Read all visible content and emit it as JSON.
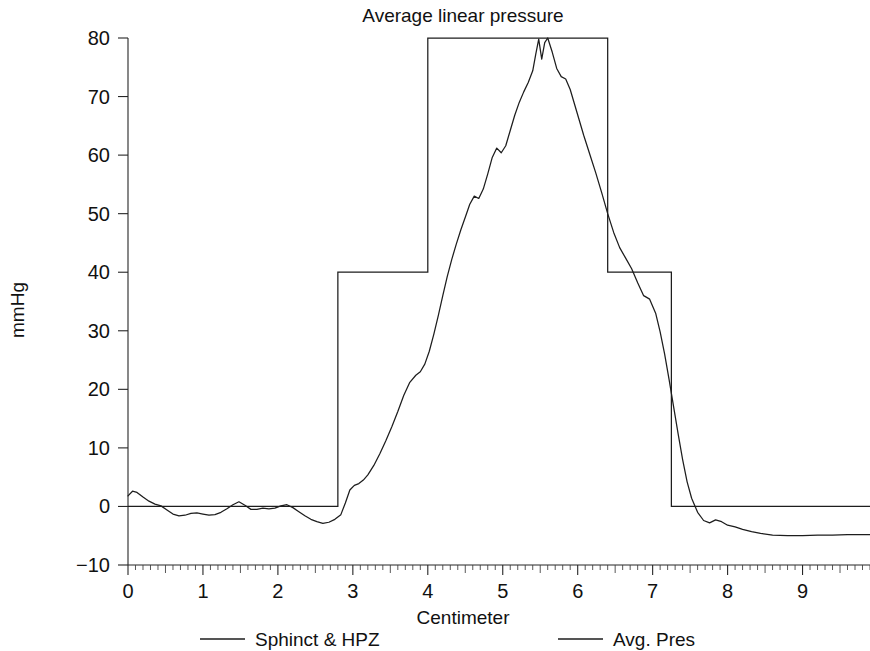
{
  "chart_data": {
    "type": "line",
    "title": "Average linear pressure",
    "xlabel": "Centimeter",
    "ylabel": "mmHg",
    "xlim": [
      0,
      9.9
    ],
    "ylim": [
      -10,
      80
    ],
    "xticks": [
      0,
      1,
      2,
      3,
      4,
      5,
      6,
      7,
      8,
      9
    ],
    "xtick_labels": [
      "0",
      "1",
      "2",
      "3",
      "4",
      "5",
      "6",
      "7",
      "8",
      "9"
    ],
    "yticks": [
      -10,
      0,
      10,
      20,
      30,
      40,
      50,
      60,
      70,
      80
    ],
    "ytick_labels": [
      "−10",
      "0",
      "10",
      "20",
      "30",
      "40",
      "50",
      "60",
      "70",
      "80"
    ],
    "grid": false,
    "legend_position": "bottom",
    "minor_tick_step": 0.1,
    "series": [
      {
        "name": "Sphinct & HPZ",
        "type": "step",
        "color": "#1d1d1d",
        "x": [
          0.0,
          2.8,
          2.8,
          4.0,
          4.0,
          6.4,
          6.4,
          7.25,
          7.25,
          9.9
        ],
        "values": [
          0,
          0,
          40,
          40,
          80,
          80,
          40,
          40,
          0,
          0
        ]
      },
      {
        "name": "Avg. Pres",
        "type": "line",
        "color": "#1d1d1d",
        "x": [
          0.0,
          0.06,
          0.12,
          0.2,
          0.28,
          0.36,
          0.44,
          0.52,
          0.6,
          0.68,
          0.76,
          0.84,
          0.92,
          1.0,
          1.08,
          1.16,
          1.24,
          1.32,
          1.4,
          1.48,
          1.56,
          1.64,
          1.72,
          1.8,
          1.88,
          1.96,
          2.04,
          2.12,
          2.2,
          2.28,
          2.36,
          2.44,
          2.52,
          2.6,
          2.68,
          2.76,
          2.84,
          2.9,
          2.96,
          3.02,
          3.08,
          3.14,
          3.2,
          3.28,
          3.36,
          3.44,
          3.52,
          3.6,
          3.68,
          3.76,
          3.84,
          3.9,
          3.96,
          4.02,
          4.08,
          4.14,
          4.2,
          4.26,
          4.32,
          4.38,
          4.44,
          4.5,
          4.56,
          4.62,
          4.68,
          4.74,
          4.8,
          4.86,
          4.92,
          4.98,
          5.04,
          5.1,
          5.16,
          5.22,
          5.28,
          5.34,
          5.4,
          5.44,
          5.48,
          5.52,
          5.56,
          5.6,
          5.66,
          5.72,
          5.78,
          5.84,
          5.9,
          5.96,
          6.02,
          6.08,
          6.16,
          6.24,
          6.32,
          6.4,
          6.48,
          6.56,
          6.64,
          6.72,
          6.8,
          6.88,
          6.96,
          7.04,
          7.1,
          7.16,
          7.22,
          7.28,
          7.34,
          7.4,
          7.46,
          7.52,
          7.6,
          7.68,
          7.76,
          7.84,
          7.92,
          8.0,
          8.1,
          8.2,
          8.32,
          8.44,
          8.6,
          8.8,
          9.0,
          9.2,
          9.4,
          9.6,
          9.8,
          9.9
        ],
        "values": [
          1.8,
          2.6,
          2.4,
          1.6,
          0.9,
          0.4,
          0.1,
          -0.6,
          -1.3,
          -1.6,
          -1.5,
          -1.2,
          -1.1,
          -1.3,
          -1.5,
          -1.4,
          -1.0,
          -0.4,
          0.3,
          0.8,
          0.2,
          -0.5,
          -0.5,
          -0.3,
          -0.4,
          -0.3,
          0.1,
          0.3,
          -0.2,
          -0.9,
          -1.6,
          -2.2,
          -2.6,
          -2.9,
          -2.7,
          -2.2,
          -1.4,
          0.6,
          2.8,
          3.6,
          3.9,
          4.5,
          5.4,
          7.0,
          9.0,
          11.2,
          13.6,
          16.2,
          19.0,
          21.2,
          22.4,
          23.0,
          24.3,
          26.5,
          29.4,
          32.6,
          36.0,
          39.3,
          42.2,
          44.8,
          47.2,
          49.4,
          51.6,
          53.0,
          52.6,
          54.2,
          56.8,
          59.6,
          61.2,
          60.4,
          61.6,
          64.2,
          66.8,
          69.0,
          70.8,
          72.4,
          74.4,
          77.2,
          79.8,
          76.4,
          79.2,
          80.0,
          77.6,
          74.8,
          73.4,
          73.0,
          71.2,
          68.6,
          66.0,
          63.4,
          60.2,
          57.0,
          53.6,
          50.0,
          46.8,
          44.2,
          42.4,
          40.6,
          38.2,
          36.0,
          35.4,
          33.0,
          29.8,
          26.0,
          21.6,
          17.0,
          12.4,
          8.0,
          4.2,
          1.4,
          -1.0,
          -2.4,
          -2.8,
          -2.3,
          -2.6,
          -3.2,
          -3.5,
          -3.9,
          -4.3,
          -4.6,
          -4.9,
          -5.0,
          -5.0,
          -4.9,
          -4.9,
          -4.8,
          -4.8,
          -4.8
        ]
      }
    ]
  },
  "legend": {
    "entries": [
      {
        "label": "Sphinct & HPZ"
      },
      {
        "label": "Avg. Pres"
      }
    ]
  }
}
